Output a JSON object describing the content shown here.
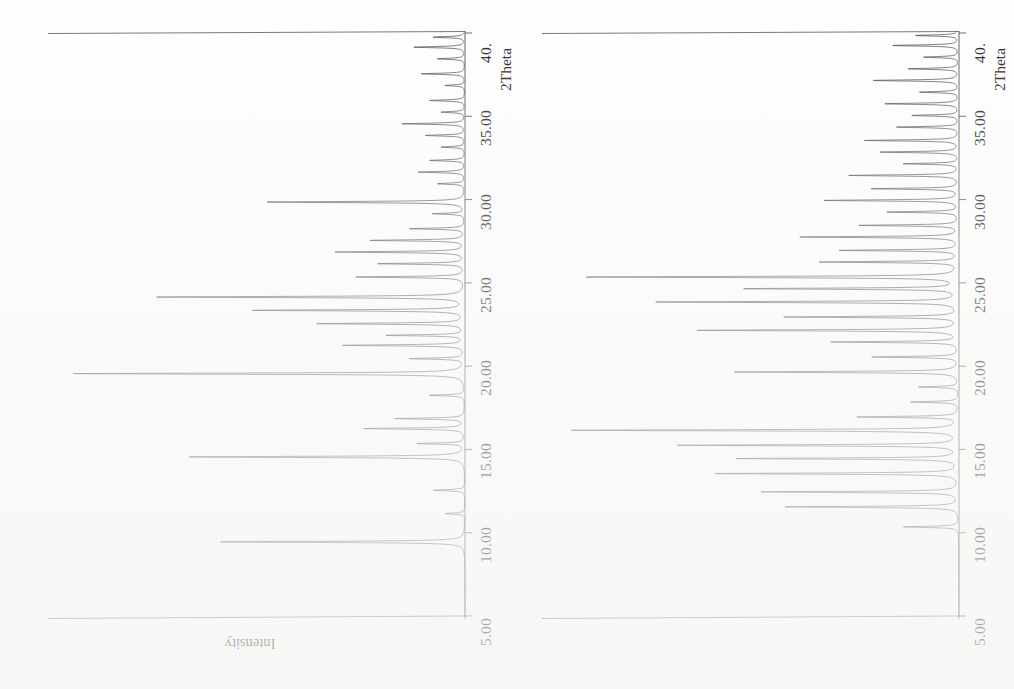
{
  "figure": {
    "title": "",
    "caption": "",
    "background_color": "#fefefe",
    "trace_color": "#3a3a3a",
    "axis_color": "#4a4a4a"
  },
  "panels": [
    {
      "id": "panel-left",
      "name": "left-diffractogram",
      "axis_title": "2Theta",
      "intensity_label": "Intensity",
      "tick_labels": [
        "5.00",
        "10.00",
        "15.00",
        "20.00",
        "25.00",
        "30.00",
        "35.00",
        "40."
      ],
      "tick_values": [
        5,
        10,
        15,
        20,
        25,
        30,
        35,
        40
      ]
    },
    {
      "id": "panel-right",
      "name": "right-diffractogram",
      "axis_title": "2Theta",
      "intensity_label": "",
      "tick_labels": [
        "5.00",
        "10.00",
        "15.00",
        "20.00",
        "25.00",
        "30.00",
        "35.00",
        "40."
      ],
      "tick_values": [
        5,
        10,
        15,
        20,
        25,
        30,
        35,
        40
      ]
    }
  ],
  "chart_data": [
    {
      "type": "line",
      "name": "left-diffractogram",
      "title": "",
      "xlabel": "2Theta",
      "ylabel": "Intensity",
      "xlim": [
        5,
        40
      ],
      "ylim": [
        0,
        100
      ],
      "grid": false,
      "legend": "none",
      "orientation": "x-axis vertical (5 at bottom, 40 at top); intensity increases to the left",
      "peaks": [
        {
          "two_theta": 9.45,
          "intensity": 62
        },
        {
          "two_theta": 11.15,
          "intensity": 5
        },
        {
          "two_theta": 12.55,
          "intensity": 8
        },
        {
          "two_theta": 14.55,
          "intensity": 70
        },
        {
          "two_theta": 15.35,
          "intensity": 12
        },
        {
          "two_theta": 16.25,
          "intensity": 26
        },
        {
          "two_theta": 16.85,
          "intensity": 18
        },
        {
          "two_theta": 18.25,
          "intensity": 9
        },
        {
          "two_theta": 19.55,
          "intensity": 100
        },
        {
          "two_theta": 20.45,
          "intensity": 14
        },
        {
          "two_theta": 21.25,
          "intensity": 31
        },
        {
          "two_theta": 21.85,
          "intensity": 20
        },
        {
          "two_theta": 22.55,
          "intensity": 38
        },
        {
          "two_theta": 23.35,
          "intensity": 54
        },
        {
          "two_theta": 24.15,
          "intensity": 78
        },
        {
          "two_theta": 25.35,
          "intensity": 28
        },
        {
          "two_theta": 26.15,
          "intensity": 22
        },
        {
          "two_theta": 26.85,
          "intensity": 33
        },
        {
          "two_theta": 27.55,
          "intensity": 24
        },
        {
          "two_theta": 28.25,
          "intensity": 14
        },
        {
          "two_theta": 29.15,
          "intensity": 8
        },
        {
          "two_theta": 29.85,
          "intensity": 50
        },
        {
          "two_theta": 30.95,
          "intensity": 7
        },
        {
          "two_theta": 31.65,
          "intensity": 12
        },
        {
          "two_theta": 32.35,
          "intensity": 9
        },
        {
          "two_theta": 33.15,
          "intensity": 6
        },
        {
          "two_theta": 33.85,
          "intensity": 10
        },
        {
          "two_theta": 34.55,
          "intensity": 16
        },
        {
          "two_theta": 35.25,
          "intensity": 6
        },
        {
          "two_theta": 35.95,
          "intensity": 9
        },
        {
          "two_theta": 36.85,
          "intensity": 5
        },
        {
          "two_theta": 37.55,
          "intensity": 11
        },
        {
          "two_theta": 38.45,
          "intensity": 7
        },
        {
          "two_theta": 39.15,
          "intensity": 13
        },
        {
          "two_theta": 39.75,
          "intensity": 8
        }
      ]
    },
    {
      "type": "line",
      "name": "right-diffractogram",
      "title": "",
      "xlabel": "2Theta",
      "ylabel": "Intensity",
      "xlim": [
        5,
        40
      ],
      "ylim": [
        0,
        100
      ],
      "grid": false,
      "legend": "none",
      "orientation": "x-axis vertical (5 at bottom, 40 at top); intensity increases to the left",
      "peaks": [
        {
          "two_theta": 10.35,
          "intensity": 14
        },
        {
          "two_theta": 11.55,
          "intensity": 44
        },
        {
          "two_theta": 12.45,
          "intensity": 50
        },
        {
          "two_theta": 13.55,
          "intensity": 62
        },
        {
          "two_theta": 14.45,
          "intensity": 56
        },
        {
          "two_theta": 15.25,
          "intensity": 71
        },
        {
          "two_theta": 16.15,
          "intensity": 100
        },
        {
          "two_theta": 16.95,
          "intensity": 26
        },
        {
          "two_theta": 17.85,
          "intensity": 12
        },
        {
          "two_theta": 18.75,
          "intensity": 10
        },
        {
          "two_theta": 19.65,
          "intensity": 58
        },
        {
          "two_theta": 20.55,
          "intensity": 22
        },
        {
          "two_theta": 21.45,
          "intensity": 32
        },
        {
          "two_theta": 22.15,
          "intensity": 66
        },
        {
          "two_theta": 22.95,
          "intensity": 44
        },
        {
          "two_theta": 23.85,
          "intensity": 78
        },
        {
          "two_theta": 24.65,
          "intensity": 55
        },
        {
          "two_theta": 25.35,
          "intensity": 96
        },
        {
          "two_theta": 26.25,
          "intensity": 35
        },
        {
          "two_theta": 26.95,
          "intensity": 30
        },
        {
          "two_theta": 27.75,
          "intensity": 40
        },
        {
          "two_theta": 28.45,
          "intensity": 25
        },
        {
          "two_theta": 29.25,
          "intensity": 18
        },
        {
          "two_theta": 29.95,
          "intensity": 34
        },
        {
          "two_theta": 30.65,
          "intensity": 22
        },
        {
          "two_theta": 31.45,
          "intensity": 28
        },
        {
          "two_theta": 32.15,
          "intensity": 14
        },
        {
          "two_theta": 32.85,
          "intensity": 20
        },
        {
          "two_theta": 33.55,
          "intensity": 24
        },
        {
          "two_theta": 34.35,
          "intensity": 16
        },
        {
          "two_theta": 35.05,
          "intensity": 12
        },
        {
          "two_theta": 35.75,
          "intensity": 19
        },
        {
          "two_theta": 36.45,
          "intensity": 10
        },
        {
          "two_theta": 37.15,
          "intensity": 22
        },
        {
          "two_theta": 37.85,
          "intensity": 13
        },
        {
          "two_theta": 38.55,
          "intensity": 9
        },
        {
          "two_theta": 39.25,
          "intensity": 17
        },
        {
          "two_theta": 39.85,
          "intensity": 11
        }
      ]
    }
  ]
}
